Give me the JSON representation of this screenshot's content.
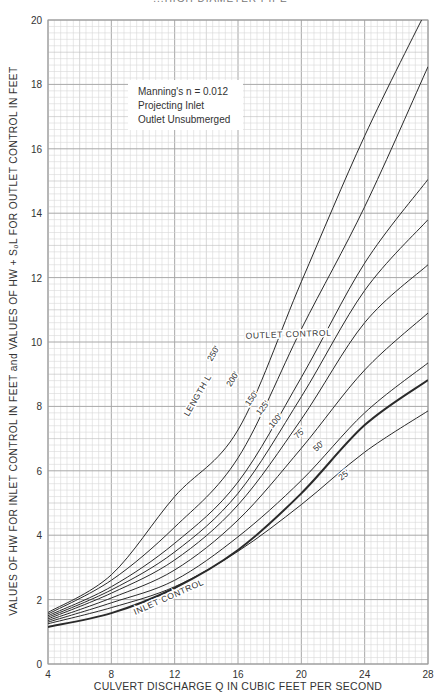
{
  "page": {
    "title_fragment": "...HIGH DIAMETER PIPE"
  },
  "legend": {
    "lines": [
      "Manning's n = 0.012",
      "Projecting Inlet",
      "Outlet Unsubmerged"
    ]
  },
  "labels": {
    "outlet_control": "OUTLET CONTROL",
    "inlet_control": "INLET CONTROL",
    "length_prefix": "LENGTH L",
    "x_axis_title": "CULVERT DISCHARGE Q IN CUBIC FEET PER SECOND",
    "y_axis_title": "VALUES OF HW FOR INLET CONTROL IN FEET and VALUES OF HW + S₀L FOR OUTLET CONTROL IN FEET"
  },
  "chart_data": {
    "type": "line",
    "title": "",
    "xlabel": "CULVERT DISCHARGE Q IN CUBIC FEET PER SECOND",
    "ylabel": "VALUES OF HW FOR INLET CONTROL IN FEET and VALUES OF HW + S0L FOR OUTLET CONTROL IN FEET",
    "xlim": [
      4,
      28
    ],
    "ylim": [
      0,
      20
    ],
    "x_ticks": [
      4,
      8,
      12,
      16,
      20,
      24,
      28
    ],
    "y_ticks": [
      0,
      2,
      4,
      6,
      8,
      10,
      12,
      14,
      16,
      18,
      20
    ],
    "grid": true,
    "annotations": [
      "Manning's n = 0.012",
      "Projecting Inlet",
      "Outlet Unsubmerged",
      "OUTLET CONTROL",
      "INLET CONTROL",
      "LENGTH L"
    ],
    "x": [
      4,
      8,
      12,
      16,
      20,
      24,
      28
    ],
    "series": [
      {
        "name": "250'",
        "group": "outlet control",
        "values": [
          1.6,
          2.77,
          5.2,
          7.27,
          11.87,
          16.4,
          20.4
        ]
      },
      {
        "name": "200'",
        "group": "outlet control",
        "values": [
          1.55,
          2.6,
          4.25,
          6.4,
          10.4,
          14.2,
          18.55
        ]
      },
      {
        "name": "150'",
        "group": "outlet control",
        "values": [
          1.5,
          2.4,
          3.75,
          5.65,
          8.9,
          12.45,
          15.05
        ]
      },
      {
        "name": "125'",
        "group": "outlet control",
        "values": [
          1.45,
          2.3,
          3.48,
          5.3,
          8.3,
          11.6,
          13.8
        ]
      },
      {
        "name": "100'",
        "group": "outlet control",
        "values": [
          1.4,
          2.2,
          3.23,
          4.94,
          7.6,
          10.6,
          12.4
        ]
      },
      {
        "name": "75'",
        "group": "outlet control",
        "values": [
          1.35,
          2.05,
          2.92,
          4.47,
          6.7,
          9.13,
          10.9
        ]
      },
      {
        "name": "50'",
        "group": "outlet control",
        "values": [
          1.3,
          1.9,
          2.6,
          3.95,
          5.7,
          7.8,
          9.35
        ]
      },
      {
        "name": "25'",
        "group": "outlet control",
        "values": [
          1.25,
          1.75,
          2.4,
          3.5,
          4.95,
          6.58,
          7.86
        ]
      },
      {
        "name": "INLET CONTROL",
        "group": "inlet control",
        "values": [
          1.15,
          1.58,
          2.36,
          3.54,
          5.3,
          7.42,
          8.82
        ]
      }
    ],
    "curve_labels": [
      {
        "text": "250'",
        "x": 14.6,
        "y": 9.6,
        "angle": -60
      },
      {
        "text": "200'",
        "x": 15.8,
        "y": 8.8,
        "angle": -58
      },
      {
        "text": "150'",
        "x": 17.0,
        "y": 8.2,
        "angle": -55
      },
      {
        "text": "125'",
        "x": 17.7,
        "y": 7.9,
        "angle": -52
      },
      {
        "text": "100'",
        "x": 18.5,
        "y": 7.5,
        "angle": -50
      },
      {
        "text": "75'",
        "x": 20.0,
        "y": 7.1,
        "angle": -45
      },
      {
        "text": "50'",
        "x": 21.2,
        "y": 6.7,
        "angle": -42
      },
      {
        "text": "25'",
        "x": 22.8,
        "y": 5.8,
        "angle": -38
      },
      {
        "text": "LENGTH L",
        "x": 13.6,
        "y": 8.3,
        "angle": -60
      },
      {
        "text": "OUTLET CONTROL",
        "x": 19.2,
        "y": 10.15,
        "angle": -2
      },
      {
        "text": "INLET CONTROL",
        "x": 11.7,
        "y": 2.0,
        "angle": -24
      }
    ]
  },
  "plot": {
    "left": 48,
    "right": 428,
    "top": 20,
    "bottom": 664,
    "line_color": "#2a2a2a",
    "grid_minor": "#d8d8d8",
    "grid_major": "#a8a8a8",
    "frame": "#9a9a9a"
  }
}
